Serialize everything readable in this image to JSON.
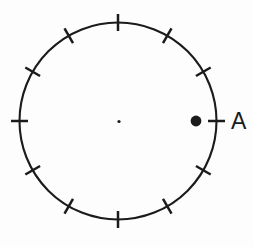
{
  "figure": {
    "background_color": "#fdfdfd",
    "stroke_color": "#1b1b1b",
    "circle": {
      "cx": 118,
      "cy": 121,
      "r": 98.5,
      "stroke_width": 2.1
    },
    "ticks": {
      "count": 12,
      "step_deg": 30,
      "start_deg": 0,
      "length": 17,
      "stroke_width": 2.5
    },
    "center_dot": {
      "cx": 119,
      "cy": 121.5,
      "r": 1.6
    },
    "point_a": {
      "cx": 196,
      "cy": 121,
      "r": 5.4
    },
    "point_a_label": {
      "text": "A",
      "x": 231,
      "y": 129,
      "font_size": 23
    }
  }
}
